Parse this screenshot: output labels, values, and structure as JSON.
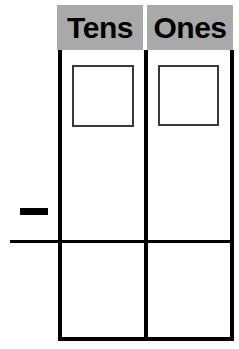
{
  "worksheet": {
    "type": "place-value-subtraction-frame",
    "width": 239,
    "height": 349,
    "background_color": "#ffffff"
  },
  "columns": {
    "header_background_color": "#a9a9a9",
    "header_text_color": "#000000",
    "tens": {
      "label": "Tens",
      "digit_value": ""
    },
    "ones": {
      "label": "Ones",
      "digit_value": ""
    }
  },
  "operator": {
    "symbol": "−",
    "name": "minus",
    "color": "#000000"
  },
  "rules": {
    "line_color": "#000000",
    "subtraction_rule_label": "",
    "bottom_rule_label": ""
  },
  "answer_row": {
    "tens_value": "",
    "ones_value": ""
  }
}
